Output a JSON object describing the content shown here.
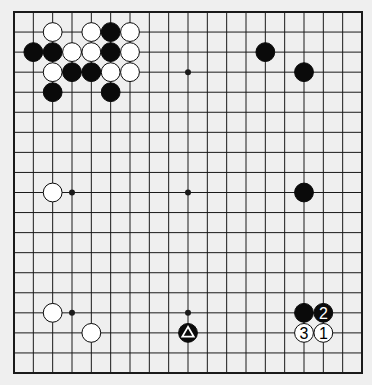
{
  "diagram": {
    "type": "go-board",
    "size": 19,
    "colors": {
      "background": "#efefef",
      "board": "#f4f4f4",
      "line": "#1a1a1a",
      "black": "#0a0a0a",
      "white": "#ffffff"
    },
    "star_points": [
      [
        3,
        3
      ],
      [
        9,
        3
      ],
      [
        15,
        3
      ],
      [
        3,
        9
      ],
      [
        9,
        9
      ],
      [
        15,
        9
      ],
      [
        3,
        15
      ],
      [
        9,
        15
      ],
      [
        15,
        15
      ]
    ],
    "stones": [
      {
        "color": "white",
        "col": 2,
        "row": 1
      },
      {
        "color": "white",
        "col": 4,
        "row": 1
      },
      {
        "color": "black",
        "col": 5,
        "row": 1
      },
      {
        "color": "white",
        "col": 6,
        "row": 1
      },
      {
        "color": "black",
        "col": 1,
        "row": 2
      },
      {
        "color": "black",
        "col": 2,
        "row": 2
      },
      {
        "color": "white",
        "col": 3,
        "row": 2
      },
      {
        "color": "white",
        "col": 4,
        "row": 2
      },
      {
        "color": "black",
        "col": 5,
        "row": 2
      },
      {
        "color": "white",
        "col": 6,
        "row": 2
      },
      {
        "color": "white",
        "col": 2,
        "row": 3
      },
      {
        "color": "black",
        "col": 3,
        "row": 3
      },
      {
        "color": "black",
        "col": 4,
        "row": 3
      },
      {
        "color": "white",
        "col": 5,
        "row": 3
      },
      {
        "color": "white",
        "col": 6,
        "row": 3
      },
      {
        "color": "black",
        "col": 2,
        "row": 4
      },
      {
        "color": "black",
        "col": 5,
        "row": 4
      },
      {
        "color": "black",
        "col": 13,
        "row": 2
      },
      {
        "color": "black",
        "col": 15,
        "row": 3
      },
      {
        "color": "white",
        "col": 2,
        "row": 9
      },
      {
        "color": "black",
        "col": 15,
        "row": 9
      },
      {
        "color": "white",
        "col": 2,
        "row": 15
      },
      {
        "color": "white",
        "col": 4,
        "row": 16
      },
      {
        "color": "black",
        "col": 9,
        "row": 16,
        "mark": "triangle"
      },
      {
        "color": "black",
        "col": 15,
        "row": 15
      },
      {
        "color": "black",
        "col": 16,
        "row": 15,
        "label": "2"
      },
      {
        "color": "white",
        "col": 16,
        "row": 16,
        "label": "1"
      },
      {
        "color": "white",
        "col": 15,
        "row": 16,
        "label": "3"
      }
    ]
  }
}
